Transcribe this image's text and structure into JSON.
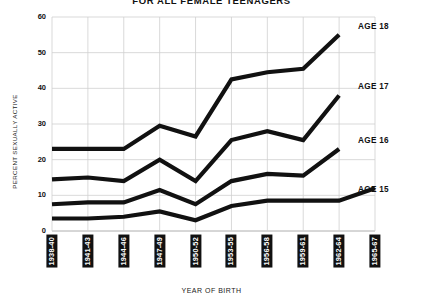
{
  "chart_data": {
    "type": "line",
    "title": "FOR ALL FEMALE TEENAGERS",
    "xlabel": "YEAR OF BIRTH",
    "ylabel": "PERCENT SEXUALLY ACTIVE",
    "categories": [
      "1938-40",
      "1941-43",
      "1944-46",
      "1947-49",
      "1950-52",
      "1953-55",
      "1956-58",
      "1959-61",
      "1962-64",
      "1965-67"
    ],
    "ylim": [
      0,
      60
    ],
    "yticks": [
      0,
      10,
      20,
      30,
      40,
      50,
      60
    ],
    "grid": true,
    "legend_position": "right-inline",
    "series": [
      {
        "name": "AGE 18",
        "values": [
          23,
          23,
          23,
          29.5,
          26.5,
          42.5,
          44.5,
          45.5,
          55,
          null
        ]
      },
      {
        "name": "AGE 17",
        "values": [
          14.5,
          15,
          14,
          20,
          14,
          25.5,
          28,
          25.5,
          38,
          null
        ]
      },
      {
        "name": "AGE 16",
        "values": [
          7.5,
          8,
          8,
          11.5,
          7.5,
          14,
          16,
          15.5,
          23,
          null
        ]
      },
      {
        "name": "AGE 15",
        "values": [
          3.5,
          3.5,
          4,
          5.5,
          3,
          7,
          8.5,
          8.5,
          8.5,
          12
        ]
      }
    ]
  },
  "axis": {
    "y_tick_labels": [
      "0",
      "10",
      "20",
      "30",
      "40",
      "50",
      "60"
    ]
  },
  "legend": {
    "items": [
      {
        "label": "AGE 18"
      },
      {
        "label": "AGE 17"
      },
      {
        "label": "AGE 16"
      },
      {
        "label": "AGE 15"
      }
    ]
  },
  "style": {
    "line_color": "#111111",
    "grid_color": "#cfcfcf",
    "axis_color": "#9a9a9a",
    "label_bg": "#111111",
    "label_fg": "#ffffff"
  }
}
